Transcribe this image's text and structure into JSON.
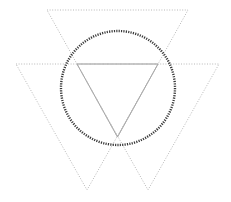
{
  "diagram": {
    "width": 231,
    "height": 202,
    "background": "#ffffff",
    "triangles": [
      {
        "name": "top-triangle",
        "points": [
          [
            47,
            10
          ],
          [
            188,
            10
          ],
          [
            117.5,
            137
          ]
        ],
        "stroke": "#b8b8b8",
        "style": "dotted"
      },
      {
        "name": "left-triangle",
        "points": [
          [
            16,
            64
          ],
          [
            158,
            64
          ],
          [
            87,
            190
          ]
        ],
        "stroke": "#b8b8b8",
        "style": "dotted"
      },
      {
        "name": "right-triangle",
        "points": [
          [
            77,
            64
          ],
          [
            219,
            64
          ],
          [
            148,
            190
          ]
        ],
        "stroke": "#b8b8b8",
        "style": "dotted"
      }
    ],
    "inner_triangle": {
      "name": "inner-solid-triangle",
      "points": [
        [
          77,
          64
        ],
        [
          158,
          64
        ],
        [
          117.5,
          137
        ]
      ],
      "stroke": "#a8a8a8",
      "style": "solid"
    },
    "circle": {
      "name": "dotted-circle",
      "cx": 118,
      "cy": 88,
      "r": 57,
      "stroke": "#3a3a3a",
      "style": "dotted"
    }
  }
}
